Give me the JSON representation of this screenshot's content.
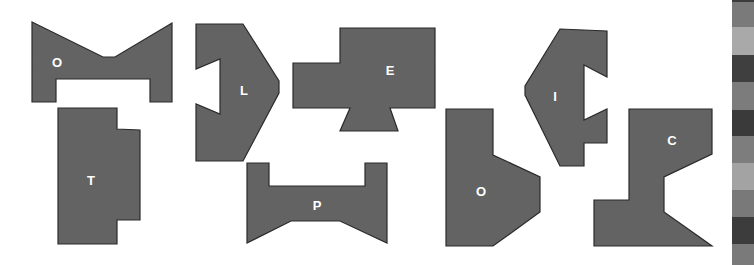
{
  "puzzle": {
    "fill_color": "#636363",
    "stroke_color": "#2a2a2a",
    "label_color": "#ffffff",
    "pieces": [
      {
        "id": "piece-o-top",
        "label": "O",
        "label_pos": [
          57,
          64
        ],
        "points": "32,22 103,57 115,57 172,23 172,102 150,102 150,79 56,79 56,102 32,102"
      },
      {
        "id": "piece-t",
        "label": "T",
        "label_pos": [
          91,
          182
        ],
        "points": "58,108 117,108 117,129 140,130 140,220 117,220 117,244 58,244"
      },
      {
        "id": "piece-l",
        "label": "L",
        "label_pos": [
          244,
          92
        ],
        "points": "196,24 243,24 279,81 279,93 243,161 196,161 196,104 220,114 220,59 196,69"
      },
      {
        "id": "piece-e",
        "label": "E",
        "label_pos": [
          390,
          72
        ],
        "points": "340,28 435,28 435,108 390,108 398,131 340,131 350,108 293,108 293,63 340,63"
      },
      {
        "id": "piece-p",
        "label": "P",
        "label_pos": [
          317,
          207
        ],
        "points": "247,163 269,163 269,186 365,186 365,163 387,163 387,243 340,221 291,221 247,243"
      },
      {
        "id": "piece-o-bottom",
        "label": "O",
        "label_pos": [
          481,
          193
        ],
        "points": "446,109 493,109 493,155 540,177 540,212 493,246 446,246"
      },
      {
        "id": "piece-i",
        "label": "I",
        "label_pos": [
          555,
          98
        ],
        "points": "560,29 607,31 607,77 584,65 584,120 607,109 607,143 584,143 584,166 560,166 525,95 525,86"
      },
      {
        "id": "piece-c",
        "label": "C",
        "label_pos": [
          672,
          142
        ],
        "points": "629,109 712,109 712,154 664,177 664,212 712,246 594,246 594,200 629,200"
      }
    ]
  },
  "gray_strip": {
    "segments": [
      {
        "top": 0,
        "height": 2,
        "color": "#3c3c3c"
      },
      {
        "top": 2,
        "height": 25,
        "color": "#7a7a7a"
      },
      {
        "top": 27,
        "height": 28,
        "color": "#a9a9a9"
      },
      {
        "top": 55,
        "height": 27,
        "color": "#3f3f3f"
      },
      {
        "top": 82,
        "height": 28,
        "color": "#7c7c7c"
      },
      {
        "top": 110,
        "height": 26,
        "color": "#3a3a3a"
      },
      {
        "top": 136,
        "height": 27,
        "color": "#7d7d7d"
      },
      {
        "top": 163,
        "height": 27,
        "color": "#a3a3a3"
      },
      {
        "top": 190,
        "height": 27,
        "color": "#797979"
      },
      {
        "top": 217,
        "height": 27,
        "color": "#3c3c3c"
      },
      {
        "top": 244,
        "height": 21,
        "color": "#7a7a7a"
      }
    ]
  }
}
